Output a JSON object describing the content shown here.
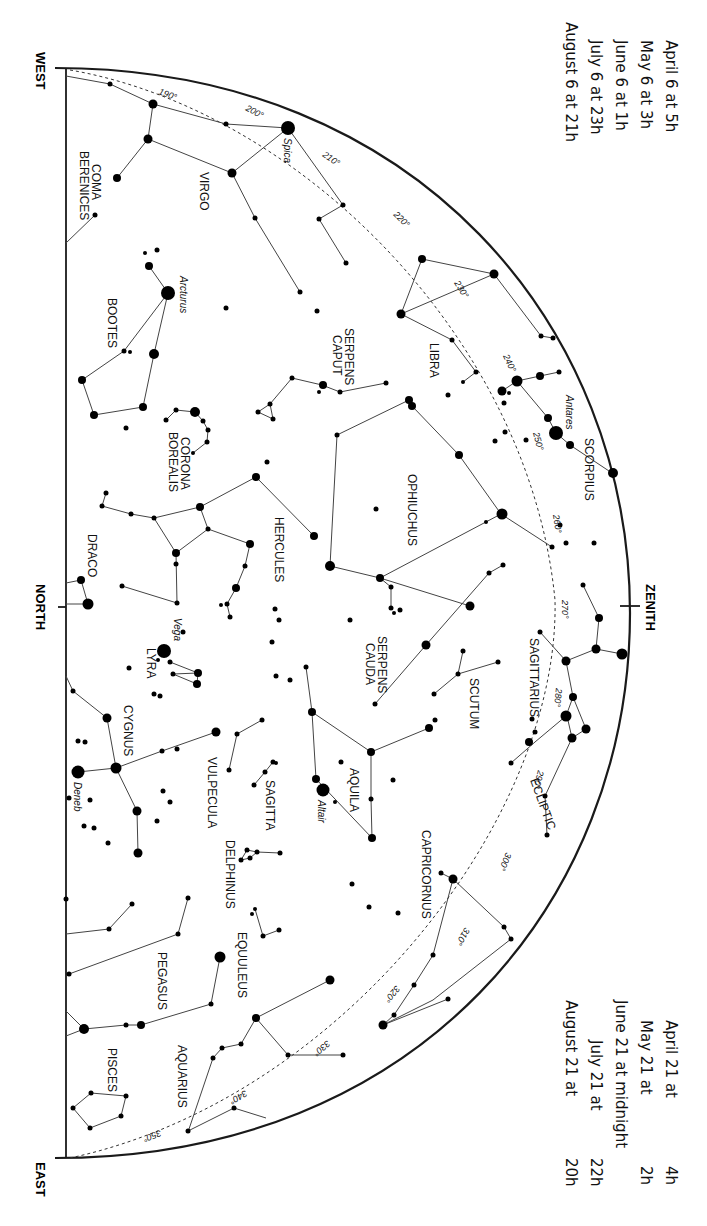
{
  "directions": {
    "west": "WEST",
    "north": "NORTH",
    "east": "EAST",
    "zenith": "ZENITH"
  },
  "ecliptic_label": "ECLIPTIC",
  "dates_top": [
    "April 6 at  5h",
    "May 6 at  3h",
    "June 6 at  1h",
    "July 6 at 23h",
    "August 6 at 21h"
  ],
  "dates_bottom": [
    {
      "date": "April 21 at",
      "time": "4h"
    },
    {
      "date": "May 21 at",
      "time": "2h"
    },
    {
      "date": "June 21 at midnight",
      "time": ""
    },
    {
      "date": "July 21 at",
      "time": "22h"
    },
    {
      "date": "August 21 at",
      "time": "20h"
    }
  ],
  "constellations": {
    "coma": [
      "COMA",
      "BERENICES"
    ],
    "virgo": "VIRGO",
    "bootes": "BOOTES",
    "serpens_caput": [
      "SERPENS",
      "CAPUT"
    ],
    "libra": "LIBRA",
    "scorpius": "SCORPIUS",
    "corona": [
      "CORONA",
      "BOREALIS"
    ],
    "ophiuchus": "OPHIUCHUS",
    "hercules": "HERCULES",
    "draco": "DRACO",
    "lyra": "LYRA",
    "serpens_cauda": [
      "SERPENS",
      "CAUDA"
    ],
    "sagittarius": "SAGITTARIUS",
    "scutum": "SCUTUM",
    "cygnus": "CYGNUS",
    "vulpecula": "VULPECULA",
    "sagitta": "SAGITTA",
    "aquila": "AQUILA",
    "delphinus": "DELPHINUS",
    "capricornus": "CAPRICORNUS",
    "equuleus": "EQUULEUS",
    "pegasus": "PEGASUS",
    "aquarius": "AQUARIUS",
    "pisces": "PISCES"
  },
  "stars": {
    "spica": "Spica",
    "arcturus": "Arcturus",
    "antares": "Antares",
    "vega": "Vega",
    "deneb": "Deneb",
    "altair": "Altair"
  },
  "ecliptic_degrees": [
    "190°",
    "200°",
    "210°",
    "220°",
    "230°",
    "240°",
    "250°",
    "260°",
    "270°",
    "280°",
    "290°",
    "300°",
    "310°",
    "320°",
    "330°",
    "340°",
    "350°"
  ]
}
